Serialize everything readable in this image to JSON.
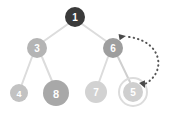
{
  "diagram": {
    "background_color": "#ffffff",
    "edge_color": "#dcdcdc",
    "edge_width": 2,
    "arrow_color": "#4a4a4a",
    "nodes": [
      {
        "id": "node-1",
        "label": "1",
        "cx": 75,
        "cy": 17,
        "r": 10,
        "fill": "#3a3a3a",
        "text_color": "#ffffff",
        "font_size": 10,
        "highlight_ring": false
      },
      {
        "id": "node-3",
        "label": "3",
        "cx": 37,
        "cy": 48,
        "r": 10,
        "fill": "#b4b4b4",
        "text_color": "#ffffff",
        "font_size": 10,
        "highlight_ring": false
      },
      {
        "id": "node-6",
        "label": "6",
        "cx": 113,
        "cy": 48,
        "r": 10,
        "fill": "#9e9e9e",
        "text_color": "#ffffff",
        "font_size": 10,
        "highlight_ring": false
      },
      {
        "id": "node-4",
        "label": "4",
        "cx": 19,
        "cy": 93,
        "r": 9,
        "fill": "#c2c2c2",
        "text_color": "#ffffff",
        "font_size": 9,
        "highlight_ring": false
      },
      {
        "id": "node-8",
        "label": "8",
        "cx": 56,
        "cy": 93,
        "r": 13,
        "fill": "#a8a8a8",
        "text_color": "#ffffff",
        "font_size": 11,
        "highlight_ring": false
      },
      {
        "id": "node-7",
        "label": "7",
        "cx": 96,
        "cy": 92,
        "r": 11,
        "fill": "#d2d2d2",
        "text_color": "#ffffff",
        "font_size": 10,
        "highlight_ring": false
      },
      {
        "id": "node-5",
        "label": "5",
        "cx": 133,
        "cy": 92,
        "r": 10,
        "fill": "#cfcfcf",
        "text_color": "#ffffff",
        "font_size": 10,
        "highlight_ring": true,
        "ring_r": 14,
        "ring_color": "#d8d8d8"
      }
    ],
    "edges": [
      {
        "id": "edge-1-3",
        "from": "node-1",
        "to": "node-3",
        "x1": 68,
        "y1": 24,
        "x2": 44,
        "y2": 41
      },
      {
        "id": "edge-1-6",
        "from": "node-1",
        "to": "node-6",
        "x1": 82,
        "y1": 24,
        "x2": 106,
        "y2": 41
      },
      {
        "id": "edge-3-4",
        "from": "node-3",
        "to": "node-4",
        "x1": 32,
        "y1": 57,
        "x2": 22,
        "y2": 84
      },
      {
        "id": "edge-3-8",
        "from": "node-3",
        "to": "node-8",
        "x1": 42,
        "y1": 57,
        "x2": 52,
        "y2": 81
      },
      {
        "id": "edge-6-7",
        "from": "node-6",
        "to": "node-7",
        "x1": 108,
        "y1": 57,
        "x2": 99,
        "y2": 82
      },
      {
        "id": "edge-6-5",
        "from": "node-6",
        "to": "node-5",
        "x1": 118,
        "y1": 57,
        "x2": 130,
        "y2": 82
      }
    ],
    "swap_arrow": {
      "id": "swap-arc",
      "label_semantic": "bidirectional-dotted-swap-arrow",
      "path": "M 126,38 C 160,40 168,72 142,86",
      "color": "#555555",
      "stroke_width": 2,
      "dash": "0.5 4",
      "head_start": {
        "x": 126,
        "y": 38,
        "rotate": -150
      },
      "head_end": {
        "x": 142,
        "y": 86,
        "rotate": 115
      },
      "head_size": 6
    }
  }
}
